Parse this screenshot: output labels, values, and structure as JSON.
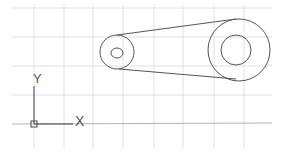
{
  "diagram": {
    "type": "cad-belt-drive-sketch",
    "axis_labels": {
      "x": "X",
      "y": "Y"
    },
    "colors": {
      "background": "#ffffff",
      "grid": "#dcdcdc",
      "axis_line": "#b0b0b0",
      "stroke": "#555555"
    },
    "grid": {
      "vertical_x": [
        34,
        64,
        93,
        123,
        154,
        183,
        214,
        244
      ],
      "horizontal_y": [
        8,
        37,
        66,
        95
      ]
    },
    "small_pulley": {
      "cx": 117,
      "cy": 52,
      "r_outer": 17,
      "rx_inner": 6,
      "ry_inner": 5
    },
    "large_pulley": {
      "cx": 238,
      "cy": 50,
      "r_outer": 31,
      "r_inner": 15
    }
  }
}
